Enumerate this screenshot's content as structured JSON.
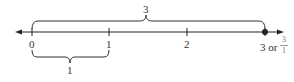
{
  "number_line": {
    "ticks": [
      {
        "value": 0,
        "label": "0"
      },
      {
        "value": 1,
        "label": "1"
      },
      {
        "value": 2,
        "label": "2"
      },
      {
        "value": 3,
        "label": "3 or"
      }
    ],
    "point": {
      "value": 3,
      "fraction_numerator": "3",
      "fraction_denominator": "1"
    },
    "top_brace": {
      "from": 0,
      "to": 3,
      "label": "3"
    },
    "bottom_brace": {
      "from": 0,
      "to": 1,
      "label": "1"
    },
    "colors": {
      "line": "#222222",
      "text": "#333333"
    }
  }
}
